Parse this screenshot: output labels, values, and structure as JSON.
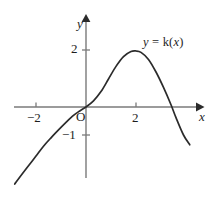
{
  "figure": {
    "background_color": "#ffffff",
    "curve_color": "#2b2b2b",
    "axis_color": "#7a7a7a",
    "text_color": "#1d1d1d"
  },
  "labels": {
    "y_axis": "y",
    "x_axis": "x",
    "origin": "O",
    "equation_lhs": "y",
    "equation_eq": "=",
    "equation_fn": "k",
    "equation_open": "(",
    "equation_var": "x",
    "equation_close": ")"
  },
  "chart_data": {
    "type": "line",
    "title": "",
    "xlabel": "x",
    "ylabel": "y",
    "legend": [
      "y = k(x)"
    ],
    "grid": false,
    "xlim": [
      -2.9,
      4.3
    ],
    "ylim": [
      -2.8,
      2.6
    ],
    "xticks": [
      -2,
      2
    ],
    "xtick_labels": [
      "−2",
      "2"
    ],
    "yticks": [
      2,
      -1
    ],
    "ytick_labels": [
      "2",
      "−1"
    ],
    "origin_label": "O",
    "series": [
      {
        "name": "y = k(x)",
        "x": [
          -2.85,
          -2.6,
          -2.3,
          -2.0,
          -1.7,
          -1.4,
          -1.1,
          -0.8,
          -0.5,
          -0.25,
          0.0,
          0.3,
          0.6,
          0.9,
          1.2,
          1.5,
          1.8,
          2.0,
          2.2,
          2.5,
          2.8,
          3.1,
          3.4,
          3.6,
          3.9,
          4.15
        ],
        "y": [
          -2.75,
          -2.45,
          -2.1,
          -1.75,
          -1.4,
          -1.1,
          -0.82,
          -0.55,
          -0.3,
          -0.14,
          0.0,
          0.22,
          0.55,
          1.0,
          1.45,
          1.8,
          1.98,
          2.0,
          1.95,
          1.7,
          1.25,
          0.7,
          0.08,
          -0.38,
          -1.0,
          -1.35
        ]
      }
    ],
    "annotations": [
      {
        "text": "y = k(x)",
        "x": 3.0,
        "y": 2.3
      }
    ],
    "features": {
      "passes_through_origin": true,
      "maximum": {
        "x": 2,
        "y": 2
      },
      "x_intercepts": [
        0,
        3.45
      ]
    }
  }
}
